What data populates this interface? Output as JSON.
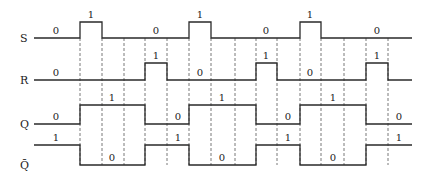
{
  "diagram": {
    "type": "timing-diagram",
    "boundaries": [
      80,
      102,
      124,
      145,
      167,
      189,
      211,
      235,
      256,
      277,
      300,
      321,
      344,
      366,
      388
    ],
    "x_start": 34,
    "x_end": 412,
    "dash_top": 38,
    "dash_bottom": 165,
    "signals": [
      {
        "name": "S",
        "label_x": 20,
        "high_y": 22,
        "low_y": 38,
        "edges": [
          [
            34,
            0
          ],
          [
            80,
            1
          ],
          [
            102,
            0
          ],
          [
            189,
            1
          ],
          [
            211,
            0
          ],
          [
            300,
            1
          ],
          [
            321,
            0
          ]
        ],
        "annotations": [
          {
            "text": "0",
            "x": 56,
            "y": 34
          },
          {
            "text": "1",
            "x": 91,
            "y": 18
          },
          {
            "text": "0",
            "x": 156,
            "y": 34
          },
          {
            "text": "1",
            "x": 200,
            "y": 18
          },
          {
            "text": "0",
            "x": 266,
            "y": 34
          },
          {
            "text": "1",
            "x": 310,
            "y": 18
          },
          {
            "text": "0",
            "x": 377,
            "y": 34
          }
        ]
      },
      {
        "name": "R",
        "label_x": 20,
        "high_y": 63,
        "low_y": 80,
        "edges": [
          [
            34,
            0
          ],
          [
            145,
            1
          ],
          [
            167,
            0
          ],
          [
            256,
            1
          ],
          [
            277,
            0
          ],
          [
            366,
            1
          ],
          [
            388,
            0
          ]
        ],
        "annotations": [
          {
            "text": "0",
            "x": 56,
            "y": 76
          },
          {
            "text": "1",
            "x": 156,
            "y": 59
          },
          {
            "text": "0",
            "x": 200,
            "y": 76
          },
          {
            "text": "1",
            "x": 266,
            "y": 59
          },
          {
            "text": "0",
            "x": 310,
            "y": 76
          },
          {
            "text": "1",
            "x": 377,
            "y": 59
          }
        ]
      },
      {
        "name": "Q",
        "label_x": 20,
        "high_y": 105,
        "low_y": 124,
        "edges": [
          [
            34,
            0
          ],
          [
            80,
            1
          ],
          [
            145,
            0
          ],
          [
            189,
            1
          ],
          [
            256,
            0
          ],
          [
            300,
            1
          ],
          [
            366,
            0
          ]
        ],
        "annotations": [
          {
            "text": "0",
            "x": 56,
            "y": 120
          },
          {
            "text": "1",
            "x": 112,
            "y": 101
          },
          {
            "text": "0",
            "x": 178,
            "y": 120
          },
          {
            "text": "1",
            "x": 222,
            "y": 101
          },
          {
            "text": "0",
            "x": 288,
            "y": 120
          },
          {
            "text": "1",
            "x": 333,
            "y": 101
          },
          {
            "text": "0",
            "x": 399,
            "y": 120
          }
        ]
      },
      {
        "name": "Q̄",
        "label_x": 20,
        "high_y": 145,
        "low_y": 165,
        "edges": [
          [
            34,
            1
          ],
          [
            80,
            0
          ],
          [
            145,
            1
          ],
          [
            189,
            0
          ],
          [
            256,
            1
          ],
          [
            300,
            0
          ],
          [
            366,
            1
          ]
        ],
        "annotations": [
          {
            "text": "1",
            "x": 56,
            "y": 141
          },
          {
            "text": "0",
            "x": 112,
            "y": 161
          },
          {
            "text": "1",
            "x": 178,
            "y": 141
          },
          {
            "text": "0",
            "x": 222,
            "y": 161
          },
          {
            "text": "1",
            "x": 288,
            "y": 141
          },
          {
            "text": "0",
            "x": 333,
            "y": 161
          },
          {
            "text": "1",
            "x": 399,
            "y": 141
          }
        ]
      }
    ]
  },
  "colors": {
    "line": "#2a2a2a",
    "dash": "#555555",
    "background": "#ffffff"
  }
}
